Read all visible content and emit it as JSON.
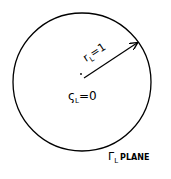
{
  "diagram": {
    "circle": {
      "cx": 82,
      "cy": 82,
      "r": 69,
      "stroke": "#000000"
    },
    "radius_arrow": {
      "from": [
        84,
        78
      ],
      "to": [
        138,
        42
      ],
      "label": "r",
      "label_sub": "L",
      "label_eq": "=1"
    },
    "center_point": {
      "x": 81,
      "y": 78
    },
    "center_label": {
      "symbol": "ς",
      "sub": "L",
      "eq": "=0"
    },
    "plane_label": {
      "symbol": "Γ",
      "sub": "L",
      "text": "PLANE"
    }
  }
}
